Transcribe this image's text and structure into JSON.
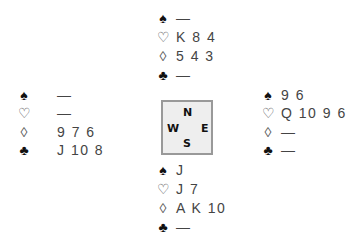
{
  "north": {
    "spades": "—",
    "hearts": "K 8 4",
    "diamonds": "5 4 3",
    "clubs": "—"
  },
  "west": {
    "spades": "—",
    "hearts": "—",
    "diamonds": "9 7 6",
    "clubs": "J 10 8"
  },
  "east": {
    "spades": "9 6",
    "hearts": "Q 10 9 6",
    "diamonds": "—",
    "clubs": "—"
  },
  "south": {
    "spades": "J",
    "hearts": "J 7",
    "diamonds": "A K 10",
    "clubs": "—"
  },
  "compass": {
    "n": "N",
    "w": "W",
    "e": "E",
    "s": "S"
  },
  "suits": {
    "spade": "♠",
    "heart": "♡",
    "diamond": "◊",
    "club": "♣"
  }
}
